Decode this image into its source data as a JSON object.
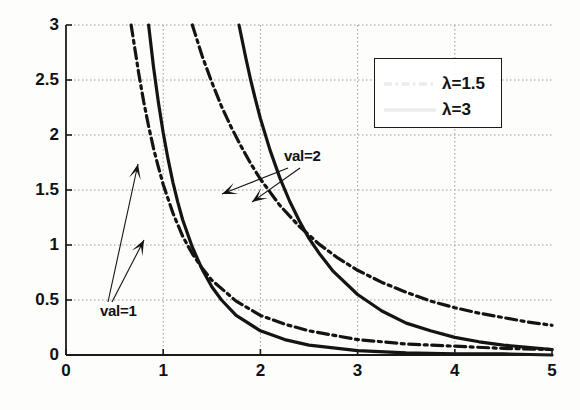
{
  "figure": {
    "background_color": "#fdfdfc",
    "axis_color": "#1a1a1a",
    "grid_color": "#9a9a9a",
    "curve_color": "#141414"
  },
  "axes": {
    "x_ticks": [
      "0",
      "1",
      "2",
      "3",
      "4",
      "5"
    ],
    "y_ticks": [
      "0",
      "0.5",
      "1",
      "1.5",
      "2",
      "2.5",
      "3"
    ]
  },
  "legend": {
    "position": "top-right",
    "entries": [
      {
        "label": "λ=1.5",
        "style": "dash-dot"
      },
      {
        "label": "λ=3",
        "style": "solid"
      }
    ]
  },
  "annotations": [
    {
      "text": "val=1",
      "x": 0.74,
      "y": 0.4
    },
    {
      "text": "val=2",
      "x": 2.11,
      "y": 1.74
    }
  ],
  "chart_data": {
    "type": "line",
    "title": "",
    "xlabel": "",
    "ylabel": "",
    "xlim": [
      0,
      5
    ],
    "ylim": [
      0,
      3
    ],
    "grid": true,
    "legend_position": "upper right",
    "x_ticks": [
      0,
      1,
      2,
      3,
      4,
      5
    ],
    "y_ticks": [
      0,
      0.5,
      1,
      1.5,
      2,
      2.5,
      3
    ],
    "series": [
      {
        "name": "λ=1.5, val=1",
        "lambda": 1.5,
        "val": 1,
        "style": "dash-dot",
        "points": [
          [
            0.67,
            3.0
          ],
          [
            0.75,
            2.55
          ],
          [
            0.8,
            2.3
          ],
          [
            0.85,
            2.08
          ],
          [
            0.9,
            1.88
          ],
          [
            0.95,
            1.71
          ],
          [
            1.0,
            1.55
          ],
          [
            1.1,
            1.29
          ],
          [
            1.2,
            1.08
          ],
          [
            1.3,
            0.92
          ],
          [
            1.4,
            0.79
          ],
          [
            1.5,
            0.68
          ],
          [
            1.75,
            0.49
          ],
          [
            2.0,
            0.36
          ],
          [
            2.25,
            0.28
          ],
          [
            2.5,
            0.22
          ],
          [
            3.0,
            0.14
          ],
          [
            3.5,
            0.1
          ],
          [
            4.0,
            0.08
          ],
          [
            4.5,
            0.06
          ],
          [
            5.0,
            0.05
          ]
        ]
      },
      {
        "name": "λ=3, val=1",
        "lambda": 3,
        "val": 1,
        "style": "solid",
        "points": [
          [
            0.85,
            3.0
          ],
          [
            0.9,
            2.62
          ],
          [
            0.95,
            2.3
          ],
          [
            1.0,
            2.02
          ],
          [
            1.05,
            1.78
          ],
          [
            1.1,
            1.57
          ],
          [
            1.15,
            1.39
          ],
          [
            1.2,
            1.23
          ],
          [
            1.3,
            0.98
          ],
          [
            1.4,
            0.78
          ],
          [
            1.5,
            0.62
          ],
          [
            1.6,
            0.5
          ],
          [
            1.75,
            0.36
          ],
          [
            2.0,
            0.22
          ],
          [
            2.25,
            0.14
          ],
          [
            2.5,
            0.09
          ],
          [
            3.0,
            0.04
          ],
          [
            3.5,
            0.02
          ],
          [
            4.0,
            0.01
          ],
          [
            4.5,
            0.01
          ],
          [
            5.0,
            0.0
          ]
        ]
      },
      {
        "name": "λ=1.5, val=2",
        "lambda": 1.5,
        "val": 2,
        "style": "dash-dot",
        "points": [
          [
            1.3,
            3.0
          ],
          [
            1.4,
            2.72
          ],
          [
            1.5,
            2.48
          ],
          [
            1.6,
            2.26
          ],
          [
            1.7,
            2.07
          ],
          [
            1.8,
            1.9
          ],
          [
            1.9,
            1.74
          ],
          [
            2.0,
            1.6
          ],
          [
            2.2,
            1.36
          ],
          [
            2.4,
            1.17
          ],
          [
            2.6,
            1.01
          ],
          [
            2.8,
            0.88
          ],
          [
            3.0,
            0.77
          ],
          [
            3.25,
            0.66
          ],
          [
            3.5,
            0.57
          ],
          [
            3.75,
            0.49
          ],
          [
            4.0,
            0.43
          ],
          [
            4.25,
            0.38
          ],
          [
            4.5,
            0.34
          ],
          [
            4.75,
            0.3
          ],
          [
            5.0,
            0.27
          ]
        ]
      },
      {
        "name": "λ=3, val=2",
        "lambda": 3,
        "val": 2,
        "style": "solid",
        "points": [
          [
            1.78,
            3.0
          ],
          [
            1.85,
            2.7
          ],
          [
            1.9,
            2.5
          ],
          [
            1.95,
            2.32
          ],
          [
            2.0,
            2.15
          ],
          [
            2.1,
            1.86
          ],
          [
            2.2,
            1.61
          ],
          [
            2.3,
            1.4
          ],
          [
            2.4,
            1.22
          ],
          [
            2.5,
            1.06
          ],
          [
            2.6,
            0.93
          ],
          [
            2.75,
            0.76
          ],
          [
            3.0,
            0.55
          ],
          [
            3.25,
            0.4
          ],
          [
            3.5,
            0.29
          ],
          [
            3.75,
            0.22
          ],
          [
            4.0,
            0.16
          ],
          [
            4.25,
            0.12
          ],
          [
            4.5,
            0.09
          ],
          [
            4.75,
            0.07
          ],
          [
            5.0,
            0.05
          ]
        ]
      }
    ],
    "annotations": [
      {
        "text": "val=1",
        "points_to": [
          "λ=1.5, val=1",
          "λ=3, val=1"
        ]
      },
      {
        "text": "val=2",
        "points_to": [
          "λ=1.5, val=2",
          "λ=3, val=2"
        ]
      }
    ]
  }
}
